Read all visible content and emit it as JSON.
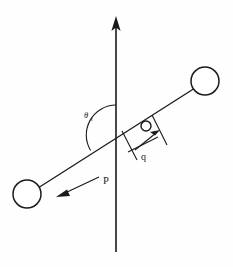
{
  "figure": {
    "background_color": "#fefefe",
    "ink_color": "#1a1a1a",
    "width": 233,
    "height": 267
  },
  "labels": {
    "angle_symbol": "θ",
    "angle_subscript": "s",
    "offset_label": "q",
    "force_label": "P"
  },
  "elements": {
    "vertical_axis": {
      "name": "vertical-axis",
      "description": "upward pointing arrow",
      "x": 116,
      "y_top": 18,
      "y_bottom": 252,
      "arrowhead": "up"
    },
    "rod": {
      "name": "rod",
      "x1": 30,
      "y1": 193,
      "x2": 203,
      "y2": 83,
      "angle_degrees": 32
    },
    "ball_upper_right": {
      "name": "mass-upper-right",
      "cx": 205,
      "cy": 81,
      "r": 14
    },
    "ball_lower_left": {
      "name": "mass-lower-left",
      "cx": 27,
      "cy": 194,
      "r": 14
    },
    "bead": {
      "name": "bead-marker",
      "cx": 146,
      "cy": 126,
      "r": 5
    },
    "angle_arc": {
      "name": "angle-arc",
      "center_x": 116,
      "center_y": 135,
      "radius": 30,
      "from": "vertical-axis-up",
      "to": "rod-lower-left"
    },
    "offset_dimension": {
      "name": "offset-dimension-q",
      "description": "double tick marks with arrow measuring distance q along rod",
      "start_x": 116,
      "start_y": 135,
      "end_x": 146,
      "end_y": 126
    },
    "force_arrow": {
      "name": "force-arrow-P",
      "description": "arrow pointing down-left along rod direction",
      "tail_x": 98,
      "tail_y": 178,
      "head_x": 58,
      "head_y": 196
    }
  }
}
